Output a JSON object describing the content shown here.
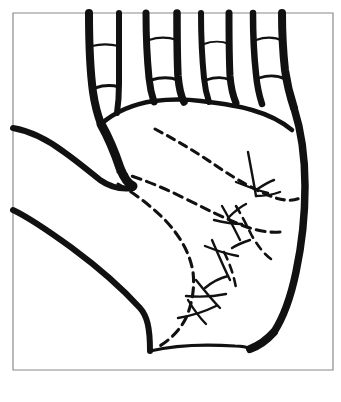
{
  "figure": {
    "title": "Palm print diagram (right hand)",
    "caption": "",
    "style": "high-contrast black ink line drawing on white background"
  },
  "frame": {
    "name": "border-frame",
    "stroke_color": "#8a8a8a",
    "fill_color": "#ffffff",
    "x": 13,
    "y": 13,
    "width": 320,
    "height": 357,
    "stroke_width": 1.2
  },
  "colors": {
    "ink": "#111111",
    "paper": "#ffffff",
    "frame": "#8a8a8a"
  },
  "anatomy": {
    "hand_outline_name": "hand-outline",
    "palm_name": "palm-surface",
    "thumb_name": "thumb",
    "fingers": [
      {
        "name": "index-finger",
        "label": "index",
        "x_left": 88,
        "x_right": 118,
        "base_y": 120
      },
      {
        "name": "middle-finger",
        "label": "middle",
        "x_left": 145,
        "x_right": 176,
        "base_y": 100
      },
      {
        "name": "ring-finger",
        "label": "ring",
        "x_left": 200,
        "x_right": 228,
        "base_y": 100
      },
      {
        "name": "little-finger",
        "label": "little",
        "x_left": 252,
        "x_right": 281,
        "base_y": 112
      }
    ],
    "knuckle_creases_count": 7,
    "wrist_name": "wrist-crease"
  },
  "palm_lines": [
    {
      "name": "heart-line",
      "style": "dashed",
      "stroke_width": 3.1,
      "dash": "8 6"
    },
    {
      "name": "head-line",
      "style": "dashed",
      "stroke_width": 3.1,
      "dash": "9 6"
    },
    {
      "name": "life-line",
      "style": "dashed",
      "stroke_width": 3.1,
      "dash": "9 6"
    },
    {
      "name": "fate-line-branch",
      "style": "dashed",
      "stroke_width": 2.6,
      "dash": "8 6"
    },
    {
      "name": "ulnar-cross-marks",
      "style": "solid",
      "stroke_width": 2.4,
      "dash": "none"
    }
  ],
  "paths": {
    "frame_rect": "M13,13 H333 V370 H13 Z",
    "index_finger_left": "M89,13 C89,40 90,70 93,92 C95,106 98,116 101,124",
    "index_finger_right": "M119,13 C119,36 119,62 119,84 C119,96 118,106 117,113",
    "index_knuckle_1": "M92,46 C100,44 110,44 119,46",
    "index_knuckle_2": "M95,88 C104,85 112,85 119,87",
    "middle_finger_left": "M146,13 C146,34 147,58 149,78 C150,88 152,96 154,102",
    "middle_finger_right": "M177,13 C177,32 177,56 178,76 C179,88 181,96 184,102",
    "middle_knuckle_1": "M149,40 C158,37 168,37 177,40",
    "middle_knuckle_2": "M151,80 C161,77 170,77 178,80",
    "ring_finger_left": "M201,13 C201,34 202,58 204,78 C205,88 207,96 209,102",
    "ring_finger_right": "M229,13 C229,32 229,56 230,76 C231,88 233,96 236,103",
    "ring_knuckle_1": "M204,44 C212,41 222,41 229,44",
    "ring_knuckle_2": "M206,80 C215,77 224,77 230,80",
    "little_finger_left": "M253,13 C253,34 254,56 256,74 C257,85 259,95 262,104",
    "little_finger_right": "M282,13 C282,30 283,52 285,70 C287,84 290,96 294,108",
    "little_knuckle_1": "M256,40 C265,37 275,37 283,41",
    "little_knuckle_2": "M259,78 C268,75 277,75 285,79",
    "palm_top_arch": "M101,124 C115,112 133,104 154,101 C170,99 186,99 201,101 C218,103 236,105 252,110 C266,114 280,120 292,130",
    "ulnar_edge": "M294,108 C301,130 305,158 305,186 C305,214 302,244 296,272 C291,296 283,318 274,332",
    "wrist_right": "M274,332 C266,341 258,346 250,349",
    "wrist_line": "M150,351 C175,345 205,344 235,346 C242,346 247,347 250,349",
    "thumb_web": "M101,124 C110,140 116,156 120,168 C124,178 128,184 133,186",
    "thumb_upper": "M13,128 C30,131 48,140 64,152 C78,162 90,172 100,180 C110,187 120,190 133,188",
    "thumb_lower": "M13,210 C30,218 50,232 72,248 C95,265 120,286 140,308 C147,316 150,327 150,351",
    "heart_line": "M155,129 C176,140 196,152 215,165 C237,180 258,192 276,198 C286,201 294,201 300,198",
    "head_line": "M118,172 C140,178 162,187 184,198 C206,209 226,219 244,226 C258,231 270,233 280,232",
    "life_line": "M118,184 C134,193 150,205 165,220 C180,236 190,253 193,272 C195,288 192,304 186,318 C180,330 170,340 158,347",
    "fate_line_branch": "M236,206 C242,216 247,226 252,236 C258,246 264,254 271,259",
    "fate_line_lower": "M224,252 C230,264 234,276 236,288",
    "cross_mark_1a": "M248,152 C251,168 254,184 256,196",
    "cross_mark_1b": "M236,182 C246,186 256,190 268,193",
    "cross_mark_1c": "M256,190 C262,186 268,182 274,180",
    "cross_mark_1d": "M256,196 C264,196 272,195 280,192",
    "cross_mark_2a": "M222,206 C228,216 234,228 240,240",
    "cross_mark_2b": "M214,220 C222,222 232,224 242,224",
    "cross_mark_2c": "M228,218 C234,212 240,207 246,204",
    "cross_mark_3a": "M212,240 C218,254 224,268 230,280",
    "cross_mark_3b": "M205,246 C215,250 226,254 238,256",
    "cross_mark_3c": "M232,248 C238,244 244,242 250,240",
    "cross_mark_4a": "M196,280 C204,290 212,300 220,308",
    "cross_mark_4b": "M186,296 C198,297 212,297 226,294",
    "cross_mark_4c": "M205,288 C212,282 220,278 228,276",
    "cross_mark_5a": "M188,300 C194,310 200,318 206,324",
    "cross_mark_5b": "M178,318 C190,316 204,312 216,306"
  }
}
